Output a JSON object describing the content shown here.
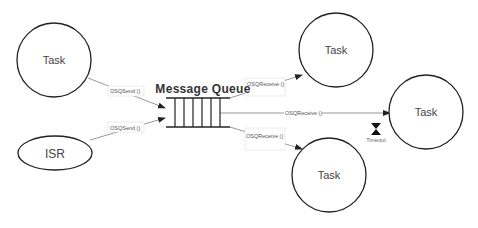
{
  "diagram": {
    "nodes": {
      "task_left": {
        "label": "Task"
      },
      "isr": {
        "label": "ISR"
      },
      "queue": {
        "label": "Message Queue"
      },
      "task_top_right": {
        "label": "Task"
      },
      "task_far_right": {
        "label": "Task"
      },
      "task_bottom_right": {
        "label": "Task"
      }
    },
    "edges": {
      "task_to_queue": {
        "label": "OSQSend ()"
      },
      "isr_to_queue": {
        "label": "OSQSend ()"
      },
      "queue_to_task_top": {
        "label": "OSQReceive ()"
      },
      "queue_to_task_far": {
        "label": "OSQReceive ()"
      },
      "queue_to_task_bottom": {
        "label": "OSQReceive ()"
      }
    },
    "timeout": {
      "label": "Timeout",
      "icon": "hourglass-icon"
    },
    "colors": {
      "stroke": "#222222",
      "edge": "#888888",
      "label_box": "#dddddd"
    }
  }
}
